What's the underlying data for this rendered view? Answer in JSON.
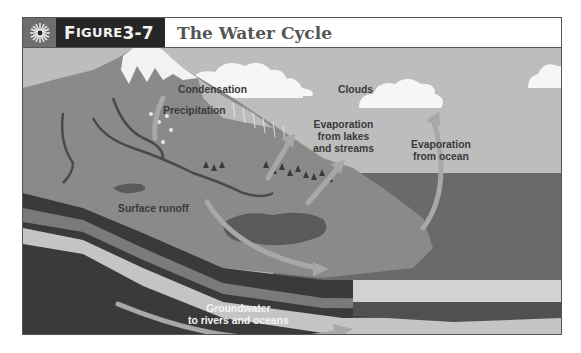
{
  "figure": {
    "number_label": "Figure 3-7",
    "number_prefix": "F",
    "number_smallcaps": "IGURE",
    "number_value": " 3-7",
    "title": "The Water Cycle",
    "icon": "sunburst-icon"
  },
  "labels": {
    "condensation": "Condensation",
    "clouds": "Clouds",
    "precipitation": "Precipitation",
    "evap_lakes_line1": "Evaporation",
    "evap_lakes_line2": "from lakes",
    "evap_lakes_line3": "and streams",
    "evap_ocean_line1": "Evaporation",
    "evap_ocean_line2": "from ocean",
    "surface_runoff": "Surface runoff",
    "groundwater_line1": "Groundwater",
    "groundwater_line2": "to rivers and oceans"
  },
  "colors": {
    "sky": "#bdbdbd",
    "mountain": "#8a8a8a",
    "snow": "#f2f2f2",
    "ocean": "#6a6a6a",
    "lake": "#5a5a5a",
    "rock_dark": "#3a3a3a",
    "arrow": "#a8a8a8",
    "header_dark": "#262626"
  }
}
